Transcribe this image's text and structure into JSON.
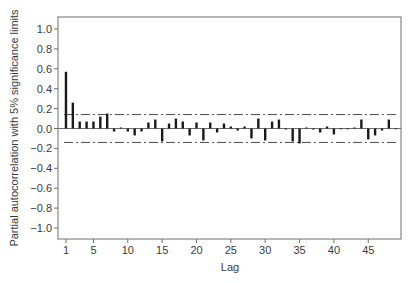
{
  "chart_data": {
    "type": "bar",
    "title": "",
    "xlabel": "Lag",
    "ylabel": "Partial autocorrelation with 5% significance limits",
    "xlim": [
      0,
      50
    ],
    "ylim": [
      -1.1,
      1.1
    ],
    "x_ticks": [
      1,
      5,
      10,
      15,
      20,
      25,
      30,
      35,
      40,
      45
    ],
    "y_ticks": [
      1.0,
      0.8,
      0.6,
      0.4,
      0.2,
      0.0,
      -0.2,
      -0.4,
      -0.6,
      -0.8,
      -1.0
    ],
    "y_tick_labels": [
      "1.0",
      "0.8",
      "0.6",
      "0.4",
      "0.2",
      "0.0",
      "−0.2",
      "−0.4",
      "−0.6",
      "−0.8",
      "−1.0"
    ],
    "significance_limits": {
      "upper": 0.14,
      "lower": -0.14,
      "style": "dash-dot"
    },
    "grid": false,
    "legend": null,
    "categories": [
      1,
      2,
      3,
      4,
      5,
      6,
      7,
      8,
      9,
      10,
      11,
      12,
      13,
      14,
      15,
      16,
      17,
      18,
      19,
      20,
      21,
      22,
      23,
      24,
      25,
      26,
      27,
      28,
      29,
      30,
      31,
      32,
      33,
      34,
      35,
      36,
      37,
      38,
      39,
      40,
      41,
      42,
      43,
      44,
      45,
      46,
      47,
      48,
      49
    ],
    "values": [
      0.57,
      0.26,
      0.07,
      0.07,
      0.07,
      0.12,
      0.15,
      -0.03,
      0.01,
      -0.03,
      -0.07,
      -0.03,
      0.06,
      0.09,
      -0.13,
      0.05,
      0.1,
      0.07,
      -0.07,
      0.06,
      -0.12,
      0.06,
      -0.04,
      0.05,
      0.02,
      -0.02,
      0.02,
      -0.1,
      0.1,
      -0.12,
      0.07,
      0.09,
      -0.01,
      -0.13,
      -0.15,
      0.01,
      -0.01,
      -0.04,
      0.02,
      -0.06,
      0.0,
      0.0,
      0.01,
      0.09,
      -0.11,
      -0.07,
      -0.02,
      0.09,
      0.0
    ]
  },
  "colors": {
    "bar": "#1a1a1a",
    "frame": "#6e6e6e",
    "limit_line": "#4a4a4a",
    "text": "#3a3a3a"
  }
}
